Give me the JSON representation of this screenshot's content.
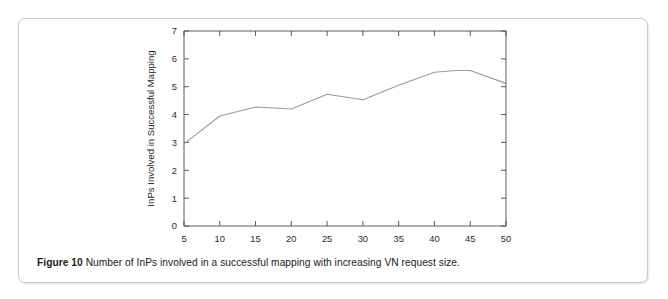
{
  "figure": {
    "caption_label": "Figure 10",
    "caption_text": "Number of InPs involved in a successful mapping with increasing VN request size."
  },
  "chart_data": {
    "type": "line",
    "title": "",
    "xlabel": "Nodes per VN Request",
    "ylabel": "InPs Involved in Successful Mapping",
    "xlim": [
      5,
      50
    ],
    "ylim": [
      0,
      7
    ],
    "xticks": [
      5,
      10,
      15,
      20,
      25,
      30,
      35,
      40,
      45,
      50
    ],
    "yticks": [
      0,
      1,
      2,
      3,
      4,
      5,
      6,
      7
    ],
    "grid": false,
    "legend": false,
    "line_color": "#9a9a9a",
    "axis_color": "#4a4a4a",
    "x": [
      5,
      10,
      15,
      20,
      25,
      30,
      35,
      40,
      43,
      45,
      50
    ],
    "values": [
      2.95,
      3.95,
      4.27,
      4.2,
      4.73,
      4.53,
      5.05,
      5.52,
      5.58,
      5.58,
      5.12
    ],
    "series": [
      {
        "name": "InPs involved",
        "values": [
          2.95,
          3.95,
          4.27,
          4.2,
          4.73,
          4.53,
          5.05,
          5.52,
          5.58,
          5.58,
          5.12
        ]
      }
    ]
  }
}
